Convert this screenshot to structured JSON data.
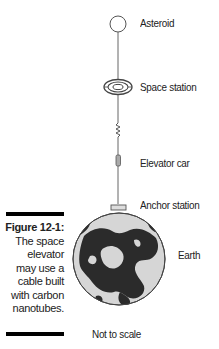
{
  "figure": {
    "number": "Figure 12-1:",
    "caption_lines": [
      "The space",
      "elevator",
      "may use a",
      "cable built",
      "with carbon",
      "nanotubes."
    ]
  },
  "labels": {
    "asteroid": "Asteroid",
    "space_station": "Space station",
    "elevator_car": "Elevator car",
    "anchor_station": "Anchor station",
    "earth": "Earth",
    "scale_note": "Not to scale"
  },
  "colors": {
    "line": "#555555",
    "earth_ocean": "#d9d9d9",
    "earth_land": "#2b2b2b",
    "bar": "#000000"
  }
}
